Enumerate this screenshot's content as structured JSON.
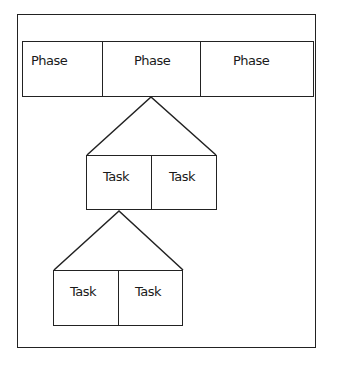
{
  "diagram": {
    "phases": [
      {
        "label": "Phase"
      },
      {
        "label": "Phase"
      },
      {
        "label": "Phase"
      }
    ],
    "level1_tasks": [
      {
        "label": "Task"
      },
      {
        "label": "Task"
      }
    ],
    "level2_tasks": [
      {
        "label": "Task"
      },
      {
        "label": "Task"
      }
    ],
    "colors": {
      "line": "#222222",
      "background": "#ffffff",
      "text": "#1a1a1a"
    }
  }
}
